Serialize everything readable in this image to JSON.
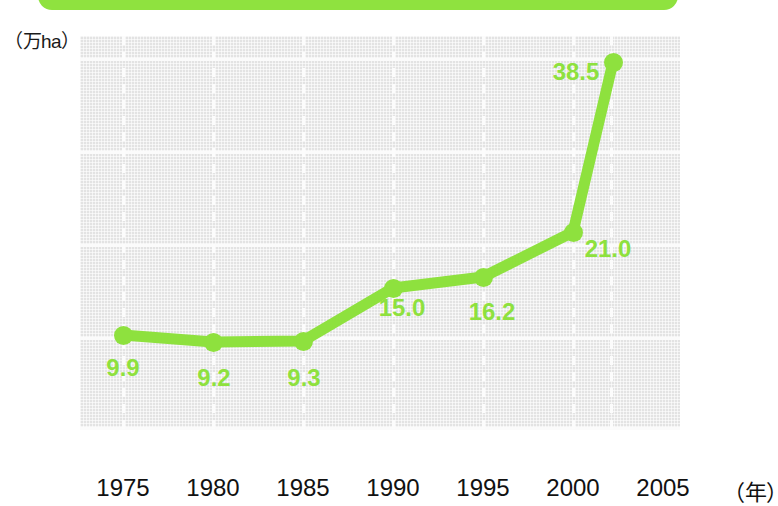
{
  "banner": {
    "text": "",
    "color": "#8FE23F"
  },
  "axes": {
    "y_unit": "（万ha）",
    "y_ticks": [
      "40",
      "30",
      "20",
      "10",
      "0"
    ],
    "x_ticks": [
      "1975",
      "1980",
      "1985",
      "1990",
      "1995",
      "2000",
      "2005"
    ],
    "x_unit": "（年）"
  },
  "colors": {
    "series": "#8EE13E",
    "plot_background": "#e3e3e3",
    "gridline": "#fbfbfb",
    "text": "#111111"
  },
  "chart_data": {
    "type": "line",
    "title": "",
    "xlabel": "（年）",
    "ylabel": "（万ha）",
    "categories": [
      "1975",
      "1980",
      "1985",
      "1990",
      "1995",
      "2000",
      "2005"
    ],
    "values": [
      9.9,
      9.2,
      9.3,
      15.0,
      16.2,
      21.0,
      38.5
    ],
    "point_labels": [
      "9.9",
      "9.2",
      "9.3",
      "15.0",
      "16.2",
      "21.0",
      "38.5"
    ],
    "ylim": [
      0,
      42
    ],
    "yticks": [
      0,
      10,
      20,
      30,
      40
    ],
    "grid": true,
    "legend": "none",
    "series_color": "#8EE13E"
  }
}
